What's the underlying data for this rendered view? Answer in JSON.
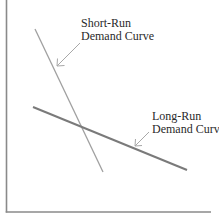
{
  "diagram": {
    "type": "economics-demand-curves",
    "colors": {
      "background": "#ffffff",
      "axis": "#8a8a8a",
      "short_run_line": "#a0a0a0",
      "long_run_line": "#7a7a7a",
      "arrow": "#a8a8a8",
      "text": "#2a2a2a"
    },
    "axes": {
      "y_axis": {
        "x": 6.5,
        "y1": 0,
        "y2": 212
      },
      "x_axis": {
        "y": 212,
        "x1": 6.5,
        "x2": 211
      }
    },
    "curves": [
      {
        "id": "short-run",
        "label_lines": [
          "Short-Run",
          "Demand Curve"
        ],
        "x1": 35,
        "y1": 29,
        "x2": 103,
        "y2": 172
      },
      {
        "id": "long-run",
        "label_lines": [
          "Long-Run",
          "Demand Curve"
        ],
        "x1": 33,
        "y1": 107,
        "x2": 187,
        "y2": 170
      }
    ],
    "labels": {
      "short_run_line1": "Short-Run",
      "short_run_line2": "Demand Curve",
      "long_run_line1": "Long-Run",
      "long_run_line2": "Demand Curve"
    }
  }
}
